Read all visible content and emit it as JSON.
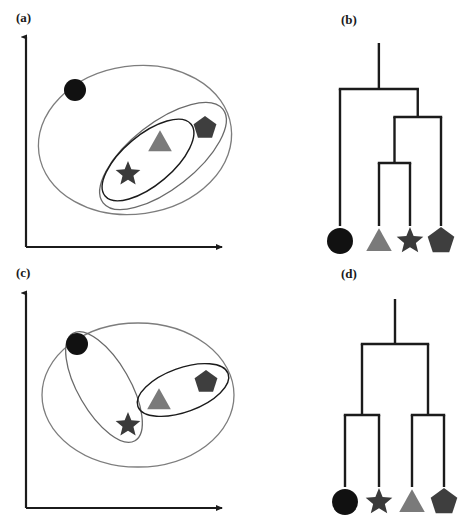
{
  "figure": {
    "width": 468,
    "height": 523,
    "background": "#ffffff",
    "panels": [
      {
        "id": "a",
        "label": "(a)",
        "type": "scatter-venn",
        "label_x": 16,
        "label_y": 10
      },
      {
        "id": "b",
        "label": "(b)",
        "type": "dendrogram",
        "label_x": 341,
        "label_y": 12
      },
      {
        "id": "c",
        "label": "(c)",
        "type": "scatter-venn",
        "label_x": 16,
        "label_y": 265
      },
      {
        "id": "d",
        "label": "(d)",
        "type": "dendrogram",
        "label_x": 341,
        "label_y": 266
      }
    ]
  },
  "colors": {
    "axis": "#1b1b1b",
    "ellipse_outer": "#7d7d7d",
    "ellipse_inner": "#4a4a4a",
    "ellipse_dark": "#1b1b1b",
    "dendrogram_line": "#1b1b1b",
    "circle_fill": "#111111",
    "star_fill": "#3a3a3a",
    "triangle_fill": "#7a7a7a",
    "pentagon_fill": "#3e3e3e",
    "label_text": "#1a1a1a"
  },
  "shapes": {
    "circle": {
      "name": "circle-marker",
      "fill": "#111111"
    },
    "triangle": {
      "name": "triangle-marker",
      "fill": "#7a7a7a"
    },
    "star": {
      "name": "star-marker",
      "fill": "#3a3a3a"
    },
    "pentagon": {
      "name": "pentagon-marker",
      "fill": "#3e3e3e"
    }
  },
  "panel_a": {
    "label": "(a)",
    "axes": {
      "x_start": [
        26,
        247
      ],
      "x_end": [
        222,
        247
      ],
      "y_start": [
        26,
        247
      ],
      "y_end": [
        26,
        37
      ]
    },
    "markers": [
      {
        "shape": "circle",
        "cx": 75,
        "cy": 90,
        "r": 11
      },
      {
        "shape": "triangle",
        "cx": 160,
        "cy": 142,
        "r": 13
      },
      {
        "shape": "star",
        "cx": 128,
        "cy": 174,
        "r": 13
      },
      {
        "shape": "pentagon",
        "cx": 205,
        "cy": 128,
        "r": 12
      }
    ],
    "groupings": [
      {
        "name": "outer-ellipse",
        "cx": 135,
        "cy": 140,
        "rx": 97,
        "ry": 74,
        "rotate": -8,
        "stroke": "#7d7d7d",
        "stroke_width": 1.3
      },
      {
        "name": "mid-ellipse",
        "cx": 163,
        "cy": 156,
        "rx": 76,
        "ry": 33,
        "rotate": -38,
        "stroke": "#6a6a6a",
        "stroke_width": 1.3
      },
      {
        "name": "inner-ellipse",
        "cx": 148,
        "cy": 160,
        "rx": 56,
        "ry": 25,
        "rotate": -40,
        "stroke": "#1b1b1b",
        "stroke_width": 1.4
      }
    ]
  },
  "panel_b": {
    "label": "(b)",
    "leaves": [
      {
        "shape": "circle",
        "x": 340,
        "y": 241,
        "r": 13
      },
      {
        "shape": "triangle",
        "x": 379,
        "y": 241,
        "r": 14
      },
      {
        "shape": "star",
        "x": 410,
        "y": 241,
        "r": 14
      },
      {
        "shape": "pentagon",
        "x": 441,
        "y": 241,
        "r": 14
      }
    ],
    "merges": [
      {
        "name": "merge-triangle-star",
        "members": [
          "triangle",
          "star"
        ],
        "height": 163
      },
      {
        "name": "merge-trianglestar-pentagon",
        "members": [
          "triangle",
          "star",
          "pentagon"
        ],
        "height": 117
      },
      {
        "name": "merge-root",
        "members": [
          "circle",
          "triangle",
          "star",
          "pentagon"
        ],
        "height": 89
      }
    ],
    "root_top": 43,
    "leaf_base": 226,
    "line_width": 2.4
  },
  "panel_c": {
    "label": "(c)",
    "axes": {
      "x_start": [
        26,
        508
      ],
      "x_end": [
        222,
        508
      ],
      "y_start": [
        26,
        508
      ],
      "y_end": [
        26,
        293
      ]
    },
    "markers": [
      {
        "shape": "circle",
        "cx": 77,
        "cy": 344,
        "r": 11
      },
      {
        "shape": "star",
        "cx": 128,
        "cy": 425,
        "r": 13
      },
      {
        "shape": "triangle",
        "cx": 159,
        "cy": 400,
        "r": 13
      },
      {
        "shape": "pentagon",
        "cx": 206,
        "cy": 382,
        "r": 12
      }
    ],
    "groupings": [
      {
        "name": "outer-ellipse",
        "cx": 138,
        "cy": 395,
        "rx": 96,
        "ry": 72,
        "rotate": 0,
        "stroke": "#7d7d7d",
        "stroke_width": 1.3
      },
      {
        "name": "cluster-circle-star",
        "cx": 104,
        "cy": 387,
        "rx": 62,
        "ry": 26,
        "rotate": 60,
        "stroke": "#6a6a6a",
        "stroke_width": 1.3
      },
      {
        "name": "cluster-triangle-pentagon",
        "cx": 183,
        "cy": 390,
        "rx": 48,
        "ry": 22,
        "rotate": -20,
        "stroke": "#1b1b1b",
        "stroke_width": 1.4
      }
    ]
  },
  "panel_d": {
    "label": "(d)",
    "leaves": [
      {
        "shape": "circle",
        "x": 345,
        "y": 502,
        "r": 13
      },
      {
        "shape": "star",
        "x": 379,
        "y": 502,
        "r": 14
      },
      {
        "shape": "triangle",
        "x": 412,
        "y": 502,
        "r": 14
      },
      {
        "shape": "pentagon",
        "x": 444,
        "y": 502,
        "r": 14
      }
    ],
    "merges": [
      {
        "name": "merge-circle-star",
        "members": [
          "circle",
          "star"
        ],
        "height": 415
      },
      {
        "name": "merge-triangle-pentagon",
        "members": [
          "triangle",
          "pentagon"
        ],
        "height": 415
      },
      {
        "name": "merge-root",
        "members": [
          "circle",
          "star",
          "triangle",
          "pentagon"
        ],
        "height": 344
      }
    ],
    "root_top": 299,
    "leaf_base": 487,
    "line_width": 2.4
  },
  "chart_data": {
    "type": "diagram",
    "items": [
      "circle",
      "triangle",
      "star",
      "pentagon"
    ],
    "panels": {
      "a": {
        "description": "Scatter of four objects with nested cluster ellipses",
        "points": [
          {
            "item": "circle",
            "x": 0.25,
            "y": 0.77
          },
          {
            "item": "triangle",
            "x": 0.69,
            "y": 0.52
          },
          {
            "item": "star",
            "x": 0.52,
            "y": 0.36
          },
          {
            "item": "pentagon",
            "x": 0.92,
            "y": 0.59
          }
        ],
        "clusters": [
          [
            "triangle",
            "star"
          ],
          [
            "triangle",
            "star",
            "pentagon"
          ],
          [
            "circle",
            "triangle",
            "star",
            "pentagon"
          ]
        ]
      },
      "b": {
        "description": "Dendrogram matching panel (a): {triangle,star} merge first, then pentagon, then circle",
        "leaf_order": [
          "circle",
          "triangle",
          "star",
          "pentagon"
        ],
        "merge_heights": [
          0.3,
          0.56,
          0.73
        ],
        "merge_order": [
          {
            "merge": [
              "triangle",
              "star"
            ],
            "height": 0.3
          },
          {
            "merge": [
              "triangle+star",
              "pentagon"
            ],
            "height": 0.56
          },
          {
            "merge": [
              "circle",
              "triangle+star+pentagon"
            ],
            "height": 0.73
          }
        ]
      },
      "c": {
        "description": "Scatter of four objects with two side-by-side clusters",
        "points": [
          {
            "item": "circle",
            "x": 0.26,
            "y": 0.76
          },
          {
            "item": "star",
            "x": 0.52,
            "y": 0.38
          },
          {
            "item": "triangle",
            "x": 0.68,
            "y": 0.5
          },
          {
            "item": "pentagon",
            "x": 0.92,
            "y": 0.58
          }
        ],
        "clusters": [
          [
            "circle",
            "star"
          ],
          [
            "triangle",
            "pentagon"
          ],
          [
            "circle",
            "star",
            "triangle",
            "pentagon"
          ]
        ]
      },
      "d": {
        "description": "Dendrogram matching panel (c): {circle,star} and {triangle,pentagon} merge at equal height, then join at root",
        "leaf_order": [
          "circle",
          "star",
          "triangle",
          "pentagon"
        ],
        "merge_heights": [
          0.38,
          0.38,
          0.76
        ],
        "merge_order": [
          {
            "merge": [
              "circle",
              "star"
            ],
            "height": 0.38
          },
          {
            "merge": [
              "triangle",
              "pentagon"
            ],
            "height": 0.38
          },
          {
            "merge": [
              "circle+star",
              "triangle+pentagon"
            ],
            "height": 0.76
          }
        ]
      }
    }
  }
}
